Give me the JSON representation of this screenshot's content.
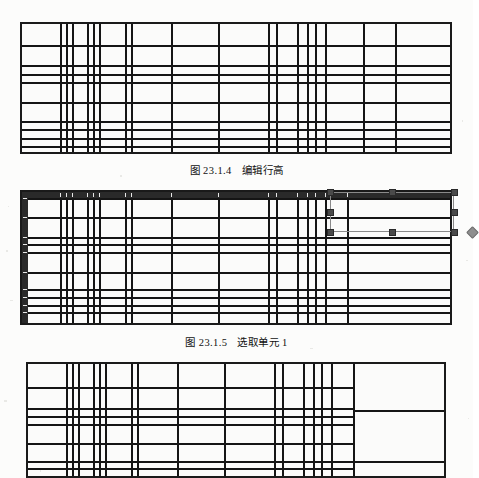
{
  "page": {
    "background_color": "#fcfcfb",
    "ink_color": "#151515",
    "width": 473,
    "height": 478,
    "document_type": "scanned-book-page"
  },
  "figures": [
    {
      "id": "fig-1",
      "caption_number": "图 23.1.4",
      "caption_title": "编辑行高",
      "kind": "spreadsheet-grid",
      "rect": {
        "x": 20,
        "y": 22,
        "width": 432,
        "height": 132
      },
      "columns_x": [
        0,
        38,
        44,
        50,
        66,
        72,
        78,
        104,
        110,
        150,
        198,
        248,
        256,
        278,
        288,
        296,
        306,
        344,
        376,
        432
      ],
      "rows_y": [
        0,
        22,
        42,
        52,
        60,
        80,
        100,
        108,
        118,
        126,
        132
      ],
      "header_selected": false,
      "selection": null
    },
    {
      "id": "fig-2",
      "caption_number": "图 23.1.5",
      "caption_title": "选取单元 1",
      "kind": "spreadsheet-grid-selected",
      "rect": {
        "x": 20,
        "y": 190,
        "width": 432,
        "height": 135
      },
      "columns_x": [
        0,
        38,
        44,
        50,
        66,
        72,
        78,
        104,
        110,
        150,
        198,
        248,
        256,
        278,
        288,
        296,
        306,
        328,
        432
      ],
      "rows_y": [
        0,
        6,
        26,
        46,
        54,
        62,
        82,
        100,
        108,
        116,
        124,
        135
      ],
      "header_selected": true,
      "header_top_height": 6,
      "header_left_width": 6,
      "selection": {
        "x": 330,
        "y": 192,
        "width": 124,
        "height": 40,
        "handle_color": "#4a4a4a",
        "outline_color": "#8a8a8a",
        "rotate_handle_color": "#8e8e8e",
        "handles": [
          {
            "name": "top-left",
            "x": 0,
            "y": 0
          },
          {
            "name": "top-center",
            "x": 62,
            "y": 0
          },
          {
            "name": "top-right",
            "x": 124,
            "y": 0
          },
          {
            "name": "middle-left",
            "x": 0,
            "y": 20
          },
          {
            "name": "middle-right",
            "x": 124,
            "y": 20
          },
          {
            "name": "bottom-left",
            "x": 0,
            "y": 40
          },
          {
            "name": "bottom-center",
            "x": 62,
            "y": 40
          },
          {
            "name": "bottom-right",
            "x": 124,
            "y": 40
          }
        ],
        "rotate_handle": {
          "name": "rotate",
          "x": 124,
          "y": 40
        }
      }
    },
    {
      "id": "fig-3",
      "caption_number": "",
      "caption_title": "",
      "kind": "spreadsheet-grid-merged",
      "rect": {
        "x": 26,
        "y": 362,
        "width": 420,
        "height": 116
      },
      "columns_x": [
        0,
        38,
        44,
        50,
        66,
        72,
        78,
        104,
        110,
        150,
        198,
        248,
        256,
        278,
        288,
        296,
        306,
        328,
        420
      ],
      "rows_y": [
        0,
        24,
        46,
        54,
        62,
        82,
        100,
        108,
        116
      ],
      "header_selected": false,
      "merged_column": {
        "start_x": 328,
        "splits_y": [
          0,
          48,
          100,
          116
        ]
      },
      "clipped_at_page_bottom": true
    }
  ],
  "captions": [
    {
      "id": "caption-1",
      "number": "图 23.1.4",
      "title": "编辑行高",
      "y": 162
    },
    {
      "id": "caption-2",
      "number": "图 23.1.5",
      "title": "选取单元 1",
      "y": 334
    }
  ]
}
